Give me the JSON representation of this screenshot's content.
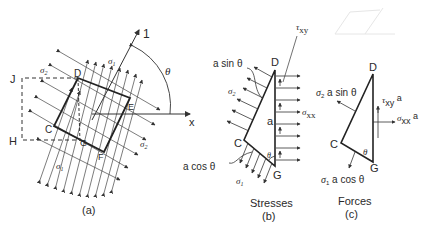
{
  "figure_a": {
    "caption": "(a)",
    "points": {
      "D": "D",
      "E": "E",
      "F": "F",
      "C": "C",
      "G": "G",
      "J": "J",
      "H": "H"
    },
    "axis_1": "1",
    "axis_x": "x",
    "angle": "θ",
    "sigma1": "σ",
    "sigma1_sub": "1",
    "sigma2": "σ",
    "sigma2_sub": "2"
  },
  "figure_b": {
    "caption_title": "Stresses",
    "caption": "(b)",
    "points": {
      "D": "D",
      "C": "C",
      "G": "G"
    },
    "side_label": "a",
    "a_sin": "a sin θ",
    "a_cos": "a cos θ",
    "sigma2": "σ",
    "sigma2_sub": "2",
    "sigma1": "σ",
    "sigma1_sub": "1",
    "tau": "τ",
    "tau_sub": "xy",
    "sigma_xx": "σ",
    "sigma_xx_sub": "xx",
    "angle": "θ"
  },
  "figure_c": {
    "caption_title": "Forces",
    "caption": "(c)",
    "points": {
      "D": "D",
      "C": "C",
      "G": "G"
    },
    "force2": "σ",
    "force2_sub": "2",
    "force2_rest": " a sin θ",
    "force1": "σ",
    "force1_sub": "1",
    "force1_rest": " a cos θ",
    "tau": "τ",
    "tau_sub": "xy",
    "tau_rest": " a",
    "sigma_xx": "σ",
    "sigma_xx_sub": "xx",
    "sigma_xx_rest": " a",
    "angle": "θ"
  }
}
